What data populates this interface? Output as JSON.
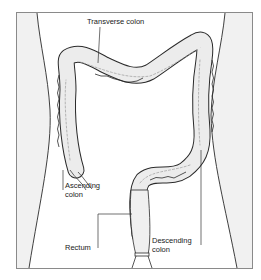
{
  "figure": {
    "labels": {
      "transverse": "Transverse colon",
      "ascending_1": "Ascending",
      "ascending_2": "colon",
      "rectum": "Rectum",
      "descending_1": "Descending",
      "descending_2": "colon"
    },
    "colors": {
      "frame": "#8a8a8a",
      "body_side_fill": "#f1f1f1",
      "outline": "#2a2a2a",
      "colon_fill": "#ececec",
      "leader": "#333333"
    }
  }
}
